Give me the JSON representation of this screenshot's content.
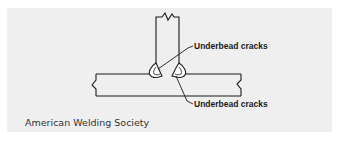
{
  "figure": {
    "callouts": [
      {
        "label": "Underbead cracks"
      },
      {
        "label": "Underbead cracks"
      }
    ],
    "credit": "American Welding Society",
    "colors": {
      "panel_background": "#efefef",
      "line": "#1a1a1a",
      "page_background": "#ffffff"
    }
  }
}
